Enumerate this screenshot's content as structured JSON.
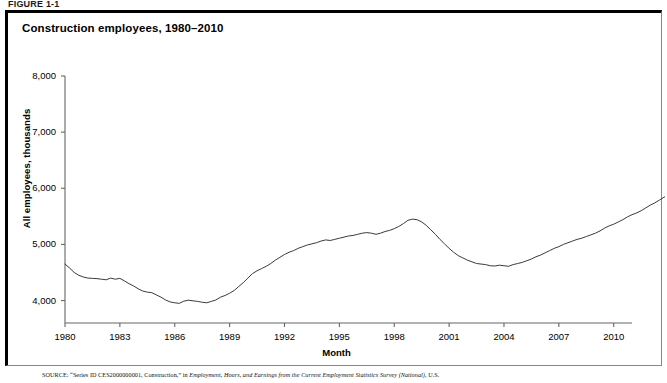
{
  "figure_label": "FIGURE 1-1",
  "chart_title": "Construction employees, 1980–2010",
  "source_note_head": "SOURCE:",
  "source_note_plain": " “Series ID CES2000000001, Construction,” in ",
  "source_note_italic": "Employment, Hours, and Earnings from the Current Employment Statistics Survey (National)",
  "source_note_tail": ", U.S.",
  "colors": {
    "line": "#3a3a3a",
    "axis": "#666666",
    "frame_dark": "#000000",
    "frame_light": "#888888",
    "background": "#ffffff"
  },
  "chart_data": {
    "type": "line",
    "title": "Construction employees, 1980–2010",
    "xlabel": "Month",
    "ylabel": "All employees, thousands",
    "xlim": [
      1980,
      2011
    ],
    "ylim": [
      3600,
      8000
    ],
    "grid": false,
    "legend": "none",
    "xticks": [
      1980,
      1983,
      1986,
      1989,
      1992,
      1995,
      1998,
      2001,
      2004,
      2007,
      2010
    ],
    "xtick_labels": [
      "1980",
      "1983",
      "1986",
      "1989",
      "1992",
      "1995",
      "1998",
      "2001",
      "2004",
      "2007",
      "2010"
    ],
    "yticks": [
      4000,
      5000,
      6000,
      7000,
      8000
    ],
    "ytick_labels": [
      "4,000",
      "5,000",
      "6,000",
      "7,000",
      "8,000"
    ],
    "series": [
      {
        "name": "Construction employees",
        "units": "thousands",
        "x_start": 1980.0,
        "x_step": 0.25,
        "values": [
          4650,
          4580,
          4500,
          4450,
          4420,
          4400,
          4395,
          4390,
          4380,
          4370,
          4400,
          4380,
          4395,
          4350,
          4300,
          4260,
          4210,
          4170,
          4150,
          4140,
          4100,
          4060,
          4010,
          3975,
          3960,
          3950,
          3990,
          4005,
          3995,
          3985,
          3970,
          3960,
          3985,
          4010,
          4060,
          4090,
          4130,
          4180,
          4250,
          4320,
          4400,
          4480,
          4530,
          4570,
          4610,
          4660,
          4720,
          4770,
          4820,
          4860,
          4890,
          4930,
          4960,
          4990,
          5010,
          5030,
          5060,
          5080,
          5070,
          5090,
          5110,
          5130,
          5150,
          5160,
          5180,
          5200,
          5210,
          5200,
          5180,
          5200,
          5230,
          5250,
          5280,
          5320,
          5370,
          5430,
          5450,
          5440,
          5400,
          5340,
          5260,
          5180,
          5090,
          5010,
          4930,
          4860,
          4800,
          4760,
          4720,
          4690,
          4660,
          4650,
          4640,
          4620,
          4615,
          4630,
          4620,
          4610,
          4640,
          4660,
          4680,
          4710,
          4740,
          4780,
          4810,
          4850,
          4890,
          4930,
          4960,
          5000,
          5030,
          5060,
          5090,
          5110,
          5140,
          5170,
          5200,
          5240,
          5290,
          5330,
          5360,
          5400,
          5440,
          5490,
          5530,
          5560,
          5600,
          5650,
          5700,
          5740,
          5790,
          5840,
          5880,
          5930,
          5970,
          6010,
          6060,
          6110,
          6150,
          6190,
          6240,
          6290,
          6340,
          6390,
          6430,
          6470,
          6520,
          6560,
          6600,
          6640,
          6680,
          6720,
          6760,
          6790,
          6800,
          6810,
          6800,
          6790,
          6790,
          6800,
          6810,
          6800,
          6780,
          6760,
          6740,
          6720,
          6710,
          6700,
          6700,
          6700,
          6710,
          6700,
          6700,
          6710,
          6730,
          6760,
          6790,
          6830,
          6880,
          6930,
          6980,
          7030,
          7080,
          7130,
          7180,
          7230,
          7290,
          7340,
          7400,
          7450,
          7520,
          7570,
          7620,
          7660,
          7690,
          7700,
          7710,
          7720,
          7725,
          7720,
          7710,
          7720,
          7715,
          7700,
          7680,
          7650,
          7600,
          7540,
          7470,
          7390,
          7300,
          7200,
          7090,
          6970,
          6840,
          6700,
          6550,
          6390,
          6220,
          6050,
          5890,
          5750,
          5640,
          5580,
          5560,
          5580,
          5570,
          5560
        ]
      }
    ]
  }
}
